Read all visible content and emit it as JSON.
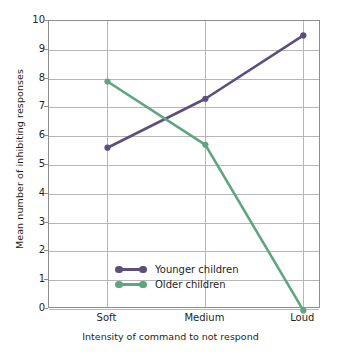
{
  "chart_data": {
    "type": "line",
    "title": "",
    "xlabel": "Intensity of command to not respond",
    "ylabel": "Mean number of inhibiting responses",
    "categories": [
      "Soft",
      "Medium",
      "Loud"
    ],
    "ylim": [
      0,
      10
    ],
    "yticks": [
      0,
      1,
      2,
      3,
      4,
      5,
      6,
      7,
      8,
      9,
      10
    ],
    "ytick_labels": [
      "0",
      "1",
      "2",
      "3",
      "4",
      "5",
      "6",
      "7",
      "8",
      "9",
      "10"
    ],
    "grid": "horizontal-and-vertical",
    "legend_position": "inside-lower-left",
    "series": [
      {
        "name": "Younger children",
        "color": "#5d4f7d",
        "values": [
          5.6,
          7.3,
          9.5
        ]
      },
      {
        "name": "Older children",
        "color": "#5fa57f",
        "values": [
          7.9,
          5.7,
          -0.05
        ]
      }
    ]
  },
  "legend": {
    "items": [
      {
        "label": "Younger children"
      },
      {
        "label": "Older children"
      }
    ]
  },
  "colors": {
    "younger": "#5d4f7d",
    "older": "#5fa57f",
    "grid": "#b6b6b6",
    "frame": "#8d8d8d",
    "text": "#231f20",
    "background": "#ffffff"
  }
}
